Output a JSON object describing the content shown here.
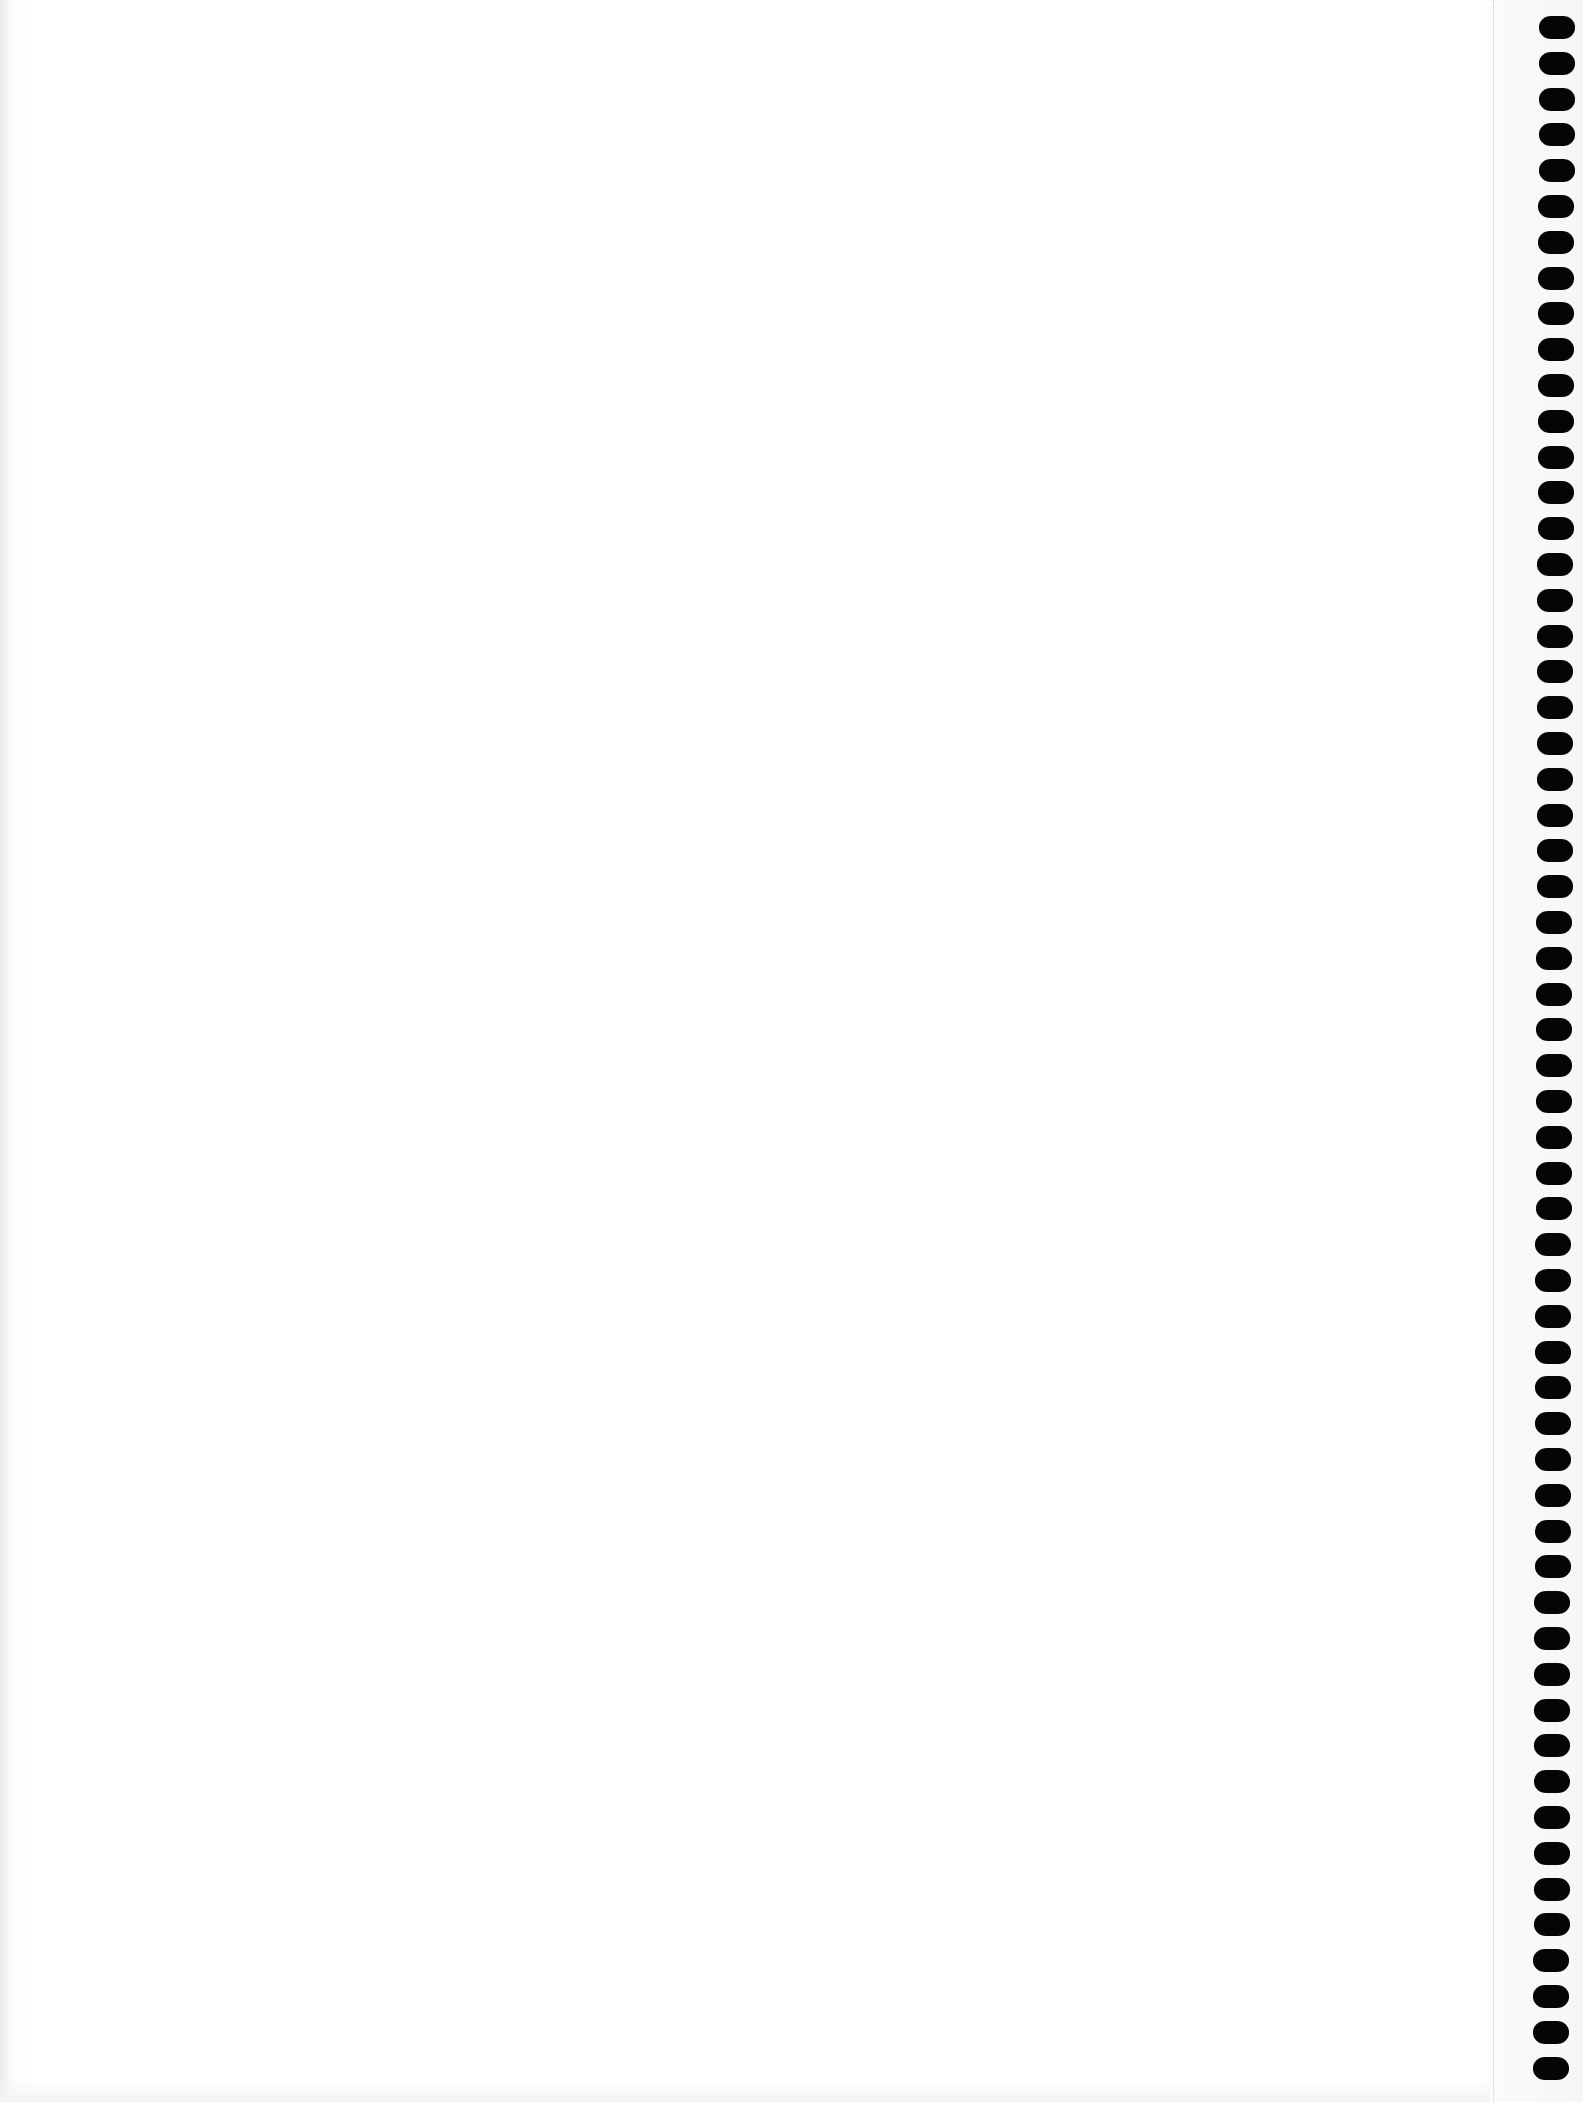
{
  "page": {
    "background_color": "#ffffff",
    "hole_color": "#050505",
    "perforation_color": "#c8c8c8"
  },
  "binding": {
    "side": "right",
    "hole_count": 58,
    "first_hole_top": 16,
    "hole_pitch": 35.8,
    "hole_left_offsets": [
      2,
      0
    ]
  }
}
